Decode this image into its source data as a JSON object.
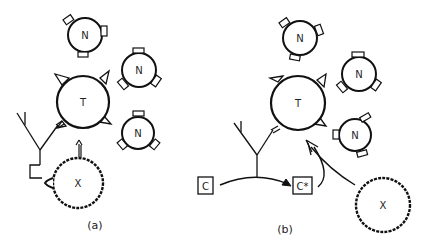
{
  "figure": {
    "panels": [
      {
        "id": "a",
        "caption": "(a)",
        "cells": {
          "target": {
            "label": "T"
          },
          "normals": [
            {
              "label": "N"
            },
            {
              "label": "N"
            },
            {
              "label": "N"
            }
          ],
          "foreign": {
            "label": "X"
          }
        }
      },
      {
        "id": "b",
        "caption": "(b)",
        "cells": {
          "target": {
            "label": "T"
          },
          "normals": [
            {
              "label": "N"
            },
            {
              "label": "N"
            },
            {
              "label": "N"
            }
          ],
          "foreign": {
            "label": "X"
          }
        },
        "complement": {
          "inactive": "C",
          "active": "C*"
        }
      }
    ]
  }
}
